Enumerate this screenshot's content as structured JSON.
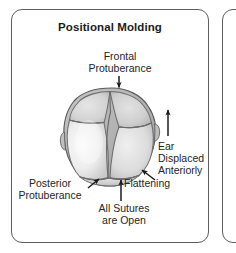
{
  "panel": {
    "title": "Positional Molding",
    "border_color": "#5e5e5e",
    "background_color": "#ffffff"
  },
  "adjacent_panel": {
    "visible": true,
    "note": ""
  },
  "labels": {
    "frontal": "Frontal\nProtuberance",
    "frontal_line1": "Frontal",
    "frontal_line2": "Protuberance",
    "ear_line1": "Ear",
    "ear_line2": "Displaced",
    "ear_line3": "Anteriorly",
    "posterior_line1": "Posterior",
    "posterior_line2": "Protuberance",
    "flattening": "Flattening",
    "sutures_line1": "All Sutures",
    "sutures_line2": "are Open"
  },
  "diagram": {
    "view": "superior (top-down) view of infant skull",
    "condition": "positional molding / plagiocephaly",
    "skull_fill_light": "#f1f1f1",
    "skull_fill_mid": "#d2d2d2",
    "skull_fill_dark": "#a9a9a9",
    "suture_color": "#6d6d6d",
    "outline_color": "#5a5a5a",
    "arrow_color": "#1b1b1b",
    "features": [
      "frontal protuberance",
      "posterior protuberance",
      "occipital flattening",
      "ear displaced anteriorly",
      "all sutures open"
    ],
    "sutures": [
      "metopic suture",
      "coronal suture",
      "sagittal suture",
      "lambdoid suture"
    ]
  },
  "arrows": {
    "frontal": "arrow-down",
    "ear": "arrow-up",
    "posterior": "arrow-up-right",
    "flattening": "arrow-up-left",
    "sutures": "arrow-up"
  }
}
